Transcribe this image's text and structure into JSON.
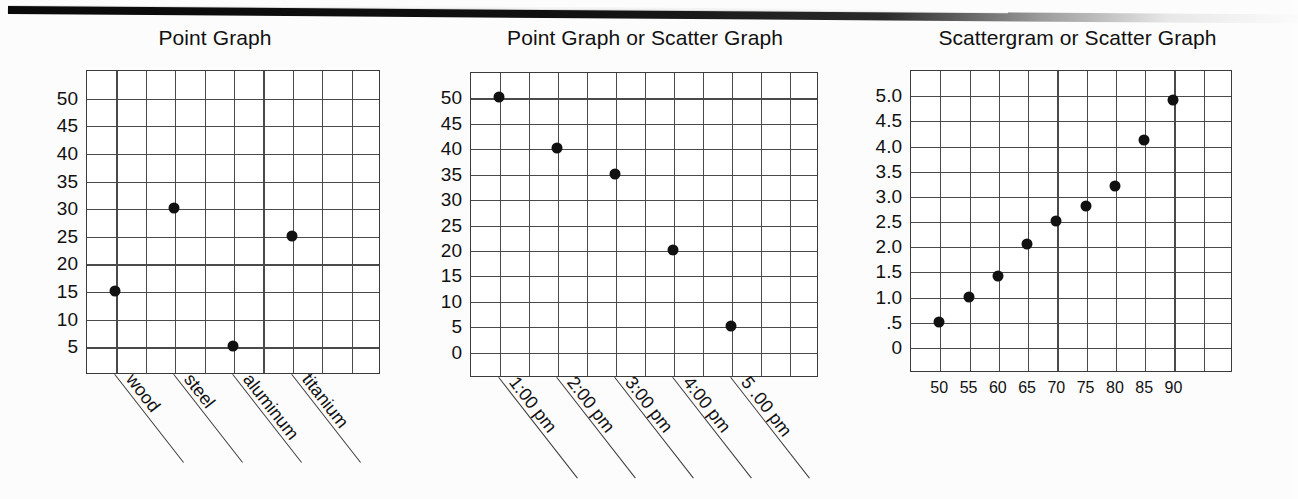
{
  "page": {
    "background_color": "#fcfcfc",
    "ink_color": "#111111",
    "grid_color": "#4a4a4a",
    "top_rule_color": "#0a0a0a"
  },
  "charts": [
    {
      "id": "point-graph",
      "title": "Point Graph",
      "chart_data": {
        "type": "scatter",
        "title": "Point Graph",
        "xlabel": "",
        "ylabel": "",
        "grid": true,
        "legend": false,
        "categories": [
          "wood",
          "steel",
          "aluminum",
          "titanium"
        ],
        "x_tick_labels": [
          "wood",
          "steel",
          "aluminum",
          "titanium"
        ],
        "y_tick_labels": [
          "5",
          "10",
          "15",
          "20",
          "25",
          "30",
          "35",
          "40",
          "45",
          "50"
        ],
        "ylim": [
          0,
          55
        ],
        "values": [
          15,
          30,
          5,
          25
        ],
        "points": [
          {
            "category": "wood",
            "value": 15
          },
          {
            "category": "steel",
            "value": 30
          },
          {
            "category": "aluminum",
            "value": 5
          },
          {
            "category": "titanium",
            "value": 25
          }
        ]
      }
    },
    {
      "id": "point-or-scatter-graph",
      "title": "Point Graph or Scatter Graph",
      "chart_data": {
        "type": "scatter",
        "title": "Point Graph or Scatter Graph",
        "xlabel": "",
        "ylabel": "",
        "grid": true,
        "legend": false,
        "categories": [
          "1:00 pm",
          "2:00 pm",
          "3:00 pm",
          "4:00 pm",
          "5 .00 pm"
        ],
        "x_tick_labels": [
          "1:00 pm",
          "2:00 pm",
          "3:00 pm",
          "4:00 pm",
          "5 .00 pm"
        ],
        "y_tick_labels": [
          "0",
          "5",
          "10",
          "15",
          "20",
          "25",
          "30",
          "35",
          "40",
          "45",
          "50"
        ],
        "ylim": [
          0,
          55
        ],
        "values": [
          50,
          40,
          35,
          20,
          5
        ],
        "points": [
          {
            "category": "1:00 pm",
            "value": 50
          },
          {
            "category": "2:00 pm",
            "value": 40
          },
          {
            "category": "3:00 pm",
            "value": 35
          },
          {
            "category": "4:00 pm",
            "value": 20
          },
          {
            "category": "5 .00 pm",
            "value": 5
          }
        ]
      }
    },
    {
      "id": "scattergram-or-scatter-graph",
      "title": "Scattergram or Scatter Graph",
      "chart_data": {
        "type": "scatter",
        "title": "Scattergram or Scatter Graph",
        "xlabel": "",
        "ylabel": "",
        "grid": true,
        "legend": false,
        "x_tick_labels": [
          "50",
          "55",
          "60",
          "65",
          "70",
          "75",
          "80",
          "85",
          "90"
        ],
        "y_tick_labels": [
          "0",
          ".5",
          "1.0",
          "1.5",
          "2.0",
          "2.5",
          "3.0",
          "3.5",
          "4.0",
          "4.5",
          "5.0"
        ],
        "xlim": [
          45,
          100
        ],
        "ylim": [
          0,
          5.5
        ],
        "x": [
          50,
          55,
          60,
          65,
          70,
          75,
          80,
          85,
          90
        ],
        "y": [
          0.5,
          1.0,
          1.4,
          2.05,
          2.5,
          2.8,
          3.2,
          4.1,
          4.9
        ],
        "points": [
          {
            "x": 50,
            "y": 0.5
          },
          {
            "x": 55,
            "y": 1.0
          },
          {
            "x": 60,
            "y": 1.4
          },
          {
            "x": 65,
            "y": 2.05
          },
          {
            "x": 70,
            "y": 2.5
          },
          {
            "x": 75,
            "y": 2.8
          },
          {
            "x": 80,
            "y": 3.2
          },
          {
            "x": 85,
            "y": 4.1
          },
          {
            "x": 90,
            "y": 4.9
          }
        ]
      }
    }
  ]
}
